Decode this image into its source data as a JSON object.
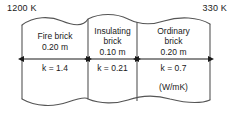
{
  "diagram": {
    "hot_side": {
      "label": "1200 K"
    },
    "cold_side": {
      "label": "330 K"
    },
    "units_note": "(W/mK)",
    "line_color": "#555555",
    "text_color": "#1a1a1a",
    "background_color": "#ffffff",
    "layers": [
      {
        "name_line1": "Fire brick",
        "name_line2": "",
        "thickness": "0.20 m",
        "conductivity": "k = 1.4"
      },
      {
        "name_line1": "Insulating",
        "name_line2": "brick",
        "thickness": "0.10 m",
        "conductivity": "k = 0.21"
      },
      {
        "name_line1": "Ordinary",
        "name_line2": "brick",
        "thickness": "0.20 m",
        "conductivity": "k = 0.7"
      }
    ]
  }
}
